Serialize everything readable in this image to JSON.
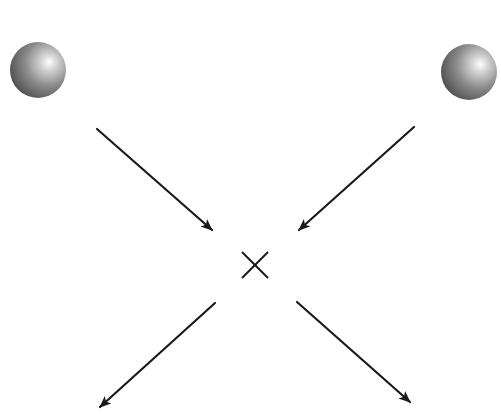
{
  "diagram": {
    "description": "Two spheres with incoming arrows converging on an interaction point marked X, and two outgoing arrows",
    "colors": {
      "background": "#ffffff",
      "arrow": "#1a1a1a",
      "sphere_dark": "#4a4a4a",
      "sphere_mid": "#8c8c8c",
      "sphere_highlight": "#ffffff"
    },
    "spheres": [
      {
        "name": "sphere-left",
        "cx": 38,
        "cy": 70,
        "r": 28
      },
      {
        "name": "sphere-right",
        "cx": 469,
        "cy": 72,
        "r": 28
      }
    ],
    "interaction_point": {
      "symbol": "×",
      "cx": 255,
      "cy": 265,
      "half_size": 13
    },
    "arrows": [
      {
        "name": "incoming-arrow-left",
        "direction": "incoming",
        "x1": 97,
        "y1": 129,
        "x2": 212,
        "y2": 230
      },
      {
        "name": "incoming-arrow-right",
        "direction": "incoming",
        "x1": 414,
        "y1": 127,
        "x2": 299,
        "y2": 230
      },
      {
        "name": "outgoing-arrow-left",
        "direction": "outgoing",
        "x1": 215,
        "y1": 303,
        "x2": 100,
        "y2": 407
      },
      {
        "name": "outgoing-arrow-right",
        "direction": "outgoing",
        "x1": 297,
        "y1": 302,
        "x2": 410,
        "y2": 402
      }
    ]
  }
}
